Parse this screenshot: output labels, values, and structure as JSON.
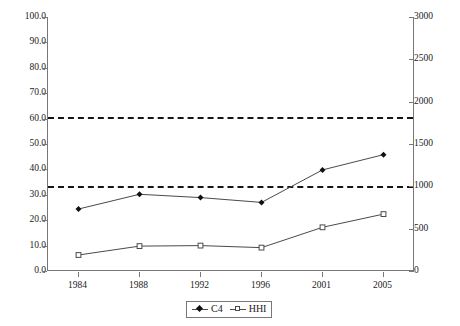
{
  "chart_data": {
    "type": "line",
    "title": "",
    "subtitle": "",
    "xlabel": "",
    "ylabel": "",
    "y2label": "",
    "categories": [
      "1984",
      "1988",
      "1992",
      "1996",
      "2001",
      "2005"
    ],
    "grid": false,
    "legend_position": "bottom-center",
    "axes": {
      "left": {
        "min": 0.0,
        "max": 100.0,
        "step": 10.0,
        "ticks": [
          "0.0",
          "10.0",
          "20.0",
          "30.0",
          "40.0",
          "50.0",
          "60.0",
          "70.0",
          "80.0",
          "90.0",
          "100.0"
        ]
      },
      "right": {
        "min": 0,
        "max": 3000,
        "step": 500,
        "ticks": [
          "0",
          "500",
          "1000",
          "1500",
          "2000",
          "2500",
          "3000"
        ]
      }
    },
    "series": [
      {
        "name": "C4",
        "axis": "left",
        "marker": "filled-diamond",
        "values": [
          24.4,
          30.2,
          28.9,
          27.0,
          39.8,
          45.8
        ]
      },
      {
        "name": "HHI",
        "axis": "right",
        "marker": "open-square",
        "values": [
          190,
          295,
          300,
          275,
          515,
          672
        ],
        "values_left_scale": [
          6.3,
          9.8,
          10.0,
          9.2,
          17.2,
          22.4
        ]
      }
    ],
    "reference_lines": [
      {
        "name": "upper-threshold",
        "left_value": 60.5,
        "right_value": 1800,
        "style": "dashed"
      },
      {
        "name": "lower-threshold",
        "left_value": 33.3,
        "right_value": 1000,
        "style": "dashed"
      }
    ],
    "legend": [
      "C4",
      "HHI"
    ]
  }
}
